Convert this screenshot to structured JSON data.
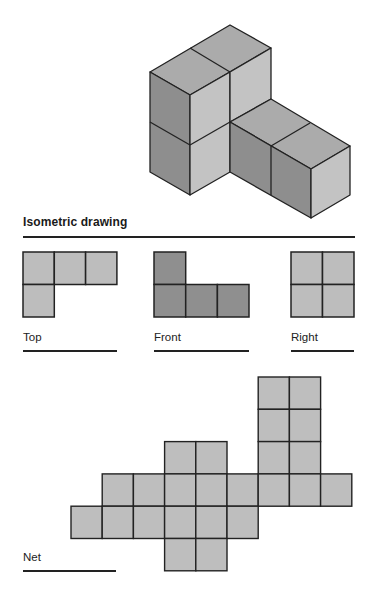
{
  "title": "Isometric drawing",
  "colors": {
    "stroke": "#222222",
    "iso_top": "#ababab",
    "iso_left": "#8e8e8e",
    "iso_right": "#c3c3c3",
    "view_light": "#bdbdbd",
    "view_dark": "#8f8f8f",
    "net_fill": "#bebebe"
  },
  "isometric": {
    "description": "L-shaped solid of 5 unit cubes: 2x2 stack of 2 cubes deep and 2 tall plus an arm of 2 cubes extending to the right",
    "cube_count": 5
  },
  "views": [
    {
      "name": "Top",
      "label": "Top",
      "shade": "light",
      "cells": [
        [
          0,
          0
        ],
        [
          1,
          0
        ],
        [
          2,
          0
        ],
        [
          0,
          1
        ]
      ]
    },
    {
      "name": "Front",
      "label": "Front",
      "shade": "dark",
      "cells": [
        [
          0,
          0
        ],
        [
          0,
          1
        ],
        [
          1,
          1
        ],
        [
          2,
          1
        ]
      ]
    },
    {
      "name": "Right",
      "label": "Right",
      "shade": "light",
      "cells": [
        [
          0,
          0
        ],
        [
          1,
          0
        ],
        [
          0,
          1
        ],
        [
          1,
          1
        ]
      ]
    }
  ],
  "net": {
    "label": "Net",
    "rows": [
      [
        6,
        7
      ],
      [
        6,
        7
      ],
      [
        3,
        4,
        6,
        7
      ],
      [
        1,
        2,
        3,
        4,
        5,
        6,
        7,
        8
      ],
      [
        0,
        1,
        2,
        3,
        4,
        5
      ],
      [
        3,
        4
      ]
    ],
    "cell_count": 22
  }
}
